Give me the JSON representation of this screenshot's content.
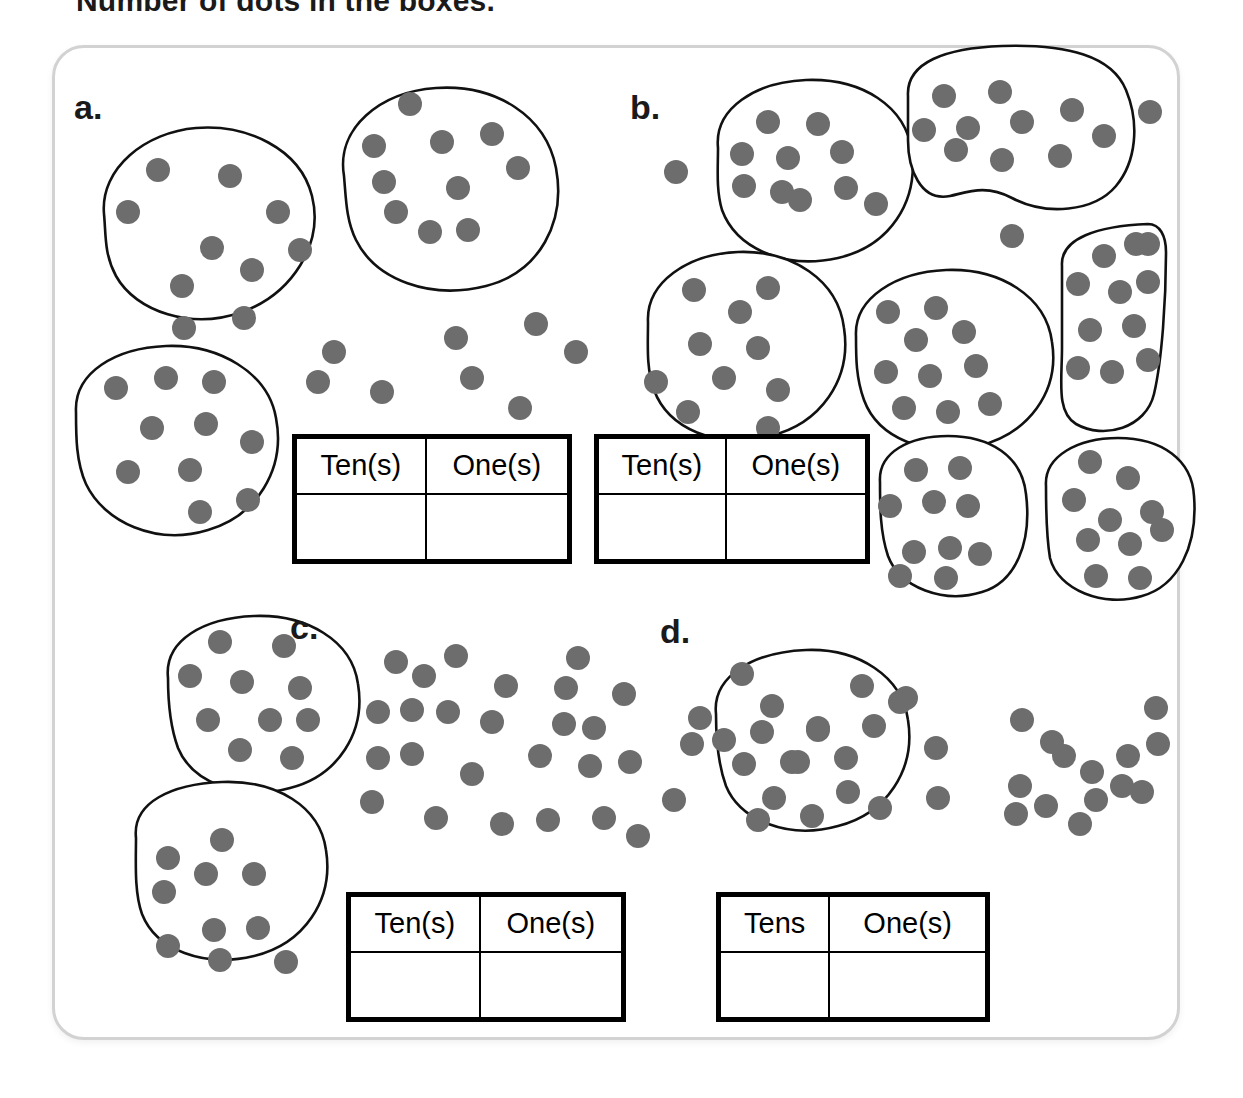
{
  "title": "Number of dots in the boxes.",
  "colors": {
    "dot": "#6d6d6d",
    "outline": "#111111",
    "frame": "#d2d2d2",
    "text": "#1a1a1a"
  },
  "frame": {
    "label": "worksheet-card"
  },
  "table_headers": {
    "tens_plural_optional": "Ten(s)",
    "tens_plain": "Tens",
    "ones_plural_optional": "One(s)"
  },
  "panels": [
    {
      "id": "a",
      "label": "a.",
      "groups_of_ten": 3,
      "loose_dots": 8,
      "total": 38,
      "table": {
        "col1": "Ten(s)",
        "col2": "One(s)",
        "answer1": "",
        "answer2": ""
      }
    },
    {
      "id": "b",
      "label": "b.",
      "groups_of_ten": 6,
      "loose_dots": 4,
      "total": 64,
      "table": {
        "col1": "Ten(s)",
        "col2": "One(s)",
        "answer1": "",
        "answer2": ""
      }
    },
    {
      "id": "c",
      "label": "c.",
      "groups_of_ten": 2,
      "loose_dots": 34,
      "total": 54,
      "table": {
        "col1": "Ten(s)",
        "col2": "One(s)",
        "answer1": "",
        "answer2": ""
      }
    },
    {
      "id": "d",
      "label": "d.",
      "groups_of_ten": 1,
      "loose_dots": 17,
      "total": 27,
      "table": {
        "col1": "Tens",
        "col2": "One(s)",
        "answer1": "",
        "answer2": ""
      }
    }
  ],
  "art": {
    "dot_radius": 12,
    "blobs": [
      {
        "panel": "a",
        "name": "blob-a-1",
        "path": "M104,214 C100,168 146,132 196,128 C246,124 300,148 312,196 C324,244 292,294 242,312 C192,330 136,312 116,276 C104,254 106,234 104,214 Z",
        "dots": [
          [
            158,
            170
          ],
          [
            230,
            176
          ],
          [
            128,
            212
          ],
          [
            212,
            248
          ],
          [
            278,
            212
          ],
          [
            182,
            286
          ],
          [
            252,
            270
          ],
          [
            300,
            250
          ],
          [
            184,
            328
          ],
          [
            244,
            318
          ]
        ]
      },
      {
        "panel": "a",
        "name": "blob-a-2",
        "path": "M344,176 C336,128 380,92 436,88 C496,84 546,116 556,168 C566,222 540,272 486,286 C430,300 376,280 356,240 C346,220 346,198 344,176 Z",
        "dots": [
          [
            410,
            104
          ],
          [
            374,
            146
          ],
          [
            492,
            134
          ],
          [
            442,
            142
          ],
          [
            518,
            168
          ],
          [
            458,
            188
          ],
          [
            384,
            182
          ],
          [
            430,
            232
          ],
          [
            468,
            230
          ],
          [
            396,
            212
          ]
        ]
      },
      {
        "panel": "a",
        "name": "blob-a-3",
        "path": "M76,412 C74,372 116,348 166,346 C218,344 268,372 276,418 C286,470 256,516 208,530 C156,546 104,522 86,484 C76,462 76,436 76,412 Z",
        "dots": [
          [
            116,
            388
          ],
          [
            166,
            378
          ],
          [
            214,
            382
          ],
          [
            152,
            428
          ],
          [
            206,
            424
          ],
          [
            252,
            442
          ],
          [
            128,
            472
          ],
          [
            190,
            470
          ],
          [
            200,
            512
          ],
          [
            248,
            500
          ]
        ]
      },
      {
        "panel": "b",
        "name": "blob-b-1",
        "path": "M718,148 C714,108 756,82 806,80 C862,78 906,106 912,152 C918,202 890,246 838,258 C784,270 736,248 722,210 C716,190 718,168 718,148 Z",
        "dots": [
          [
            768,
            122
          ],
          [
            818,
            124
          ],
          [
            742,
            154
          ],
          [
            788,
            158
          ],
          [
            842,
            152
          ],
          [
            782,
            192
          ],
          [
            846,
            188
          ],
          [
            744,
            186
          ],
          [
            800,
            200
          ],
          [
            876,
            204
          ]
        ]
      },
      {
        "panel": "b",
        "name": "blob-b-2",
        "path": "M908,96 C906,62 946,48 1002,46 C1068,44 1112,56 1126,90 C1140,124 1136,162 1116,186 C1094,212 1046,216 1012,198 C986,184 968,192 950,196 C920,202 908,168 908,140 Z",
        "dots": [
          [
            944,
            96
          ],
          [
            1000,
            92
          ],
          [
            924,
            130
          ],
          [
            968,
            128
          ],
          [
            1022,
            122
          ],
          [
            1072,
            110
          ],
          [
            1104,
            136
          ],
          [
            956,
            150
          ],
          [
            1002,
            160
          ],
          [
            1060,
            156
          ]
        ]
      },
      {
        "panel": "b",
        "name": "blob-b-3",
        "path": "M648,322 C646,282 688,254 738,252 C792,250 838,280 844,328 C852,380 820,424 770,436 C716,450 668,428 654,390 C646,368 648,344 648,322 Z",
        "dots": [
          [
            694,
            290
          ],
          [
            740,
            312
          ],
          [
            768,
            288
          ],
          [
            700,
            344
          ],
          [
            758,
            348
          ],
          [
            724,
            378
          ],
          [
            778,
            390
          ],
          [
            656,
            382
          ],
          [
            688,
            412
          ],
          [
            768,
            428
          ]
        ]
      },
      {
        "panel": "b",
        "name": "blob-b-4",
        "path": "M856,336 C854,298 896,272 946,270 C1000,268 1046,296 1052,342 C1060,392 1028,434 978,446 C926,458 878,438 864,400 C856,378 856,358 856,336 Z",
        "dots": [
          [
            888,
            312
          ],
          [
            936,
            308
          ],
          [
            916,
            340
          ],
          [
            964,
            332
          ],
          [
            886,
            372
          ],
          [
            930,
            376
          ],
          [
            976,
            366
          ],
          [
            904,
            408
          ],
          [
            948,
            412
          ],
          [
            990,
            404
          ]
        ]
      },
      {
        "panel": "b",
        "name": "blob-b-5",
        "path": "M1062,266 C1060,238 1098,226 1148,224 C1160,224 1166,236 1166,252 C1166,300 1162,360 1154,394 C1146,428 1104,440 1076,424 C1056,412 1062,380 1062,348 Z",
        "dots": [
          [
            1104,
            256
          ],
          [
            1148,
            244
          ],
          [
            1078,
            284
          ],
          [
            1120,
            292
          ],
          [
            1148,
            282
          ],
          [
            1090,
            330
          ],
          [
            1134,
            326
          ],
          [
            1078,
            368
          ],
          [
            1112,
            372
          ],
          [
            1148,
            360
          ]
        ]
      },
      {
        "panel": "b",
        "name": "blob-b-6",
        "path": "M880,482 C878,452 910,436 948,436 C990,436 1022,456 1026,494 C1032,542 1016,582 982,592 C944,604 900,588 888,556 C880,532 880,506 880,482 Z",
        "dots": [
          [
            916,
            470
          ],
          [
            960,
            468
          ],
          [
            890,
            506
          ],
          [
            934,
            502
          ],
          [
            968,
            506
          ],
          [
            914,
            552
          ],
          [
            950,
            548
          ],
          [
            980,
            554
          ],
          [
            900,
            576
          ],
          [
            946,
            578
          ]
        ]
      },
      {
        "panel": "b",
        "name": "blob-b-7",
        "path": "M1046,486 C1044,456 1078,438 1118,438 C1162,438 1192,460 1194,496 C1198,546 1178,586 1142,596 C1104,608 1058,590 1050,558 C1046,534 1046,510 1046,486 Z",
        "dots": [
          [
            1090,
            462
          ],
          [
            1128,
            478
          ],
          [
            1074,
            500
          ],
          [
            1110,
            520
          ],
          [
            1152,
            512
          ],
          [
            1088,
            540
          ],
          [
            1130,
            544
          ],
          [
            1162,
            530
          ],
          [
            1096,
            576
          ],
          [
            1140,
            578
          ]
        ]
      },
      {
        "panel": "c",
        "name": "blob-c-1",
        "path": "M168,678 C164,640 204,618 254,616 C306,614 352,640 358,684 C366,732 338,776 290,788 C240,802 192,782 178,748 C170,726 168,700 168,678 Z",
        "dots": [
          [
            220,
            642
          ],
          [
            284,
            646
          ],
          [
            190,
            676
          ],
          [
            242,
            682
          ],
          [
            300,
            688
          ],
          [
            208,
            720
          ],
          [
            270,
            720
          ],
          [
            308,
            720
          ],
          [
            240,
            750
          ],
          [
            292,
            758
          ]
        ]
      },
      {
        "panel": "c",
        "name": "blob-c-2",
        "path": "M136,838 C132,802 172,784 222,782 C276,780 320,806 326,850 C334,900 304,944 254,956 C204,968 156,950 142,914 C134,892 136,860 136,838 Z",
        "dots": [
          [
            222,
            840
          ],
          [
            168,
            858
          ],
          [
            206,
            874
          ],
          [
            254,
            874
          ],
          [
            164,
            892
          ],
          [
            214,
            930
          ],
          [
            258,
            928
          ],
          [
            168,
            946
          ],
          [
            220,
            960
          ],
          [
            286,
            962
          ]
        ]
      },
      {
        "panel": "d",
        "name": "blob-d-1",
        "path": "M716,714 C712,676 754,652 806,650 C858,648 902,676 908,720 C916,770 886,814 838,826 C788,840 740,820 726,786 C718,764 716,736 716,714 Z",
        "dots": [
          [
            762,
            732
          ],
          [
            818,
            730
          ],
          [
            744,
            764
          ],
          [
            792,
            762
          ],
          [
            846,
            758
          ],
          [
            774,
            798
          ],
          [
            848,
            792
          ],
          [
            758,
            820
          ],
          [
            812,
            816
          ],
          [
            880,
            808
          ]
        ]
      }
    ],
    "loose_dots": [
      {
        "panel": "a",
        "points": [
          [
            318,
            382
          ],
          [
            334,
            352
          ],
          [
            382,
            392
          ],
          [
            456,
            338
          ],
          [
            472,
            378
          ],
          [
            520,
            408
          ],
          [
            536,
            324
          ],
          [
            576,
            352
          ]
        ]
      },
      {
        "panel": "b",
        "points": [
          [
            676,
            172
          ],
          [
            1150,
            112
          ],
          [
            1012,
            236
          ],
          [
            1136,
            244
          ]
        ]
      },
      {
        "panel": "c",
        "points": [
          [
            396,
            662
          ],
          [
            424,
            676
          ],
          [
            456,
            656
          ],
          [
            578,
            658
          ],
          [
            506,
            686
          ],
          [
            566,
            688
          ],
          [
            624,
            694
          ],
          [
            742,
            674
          ],
          [
            862,
            686
          ],
          [
            900,
            702
          ],
          [
            378,
            712
          ],
          [
            412,
            710
          ],
          [
            448,
            712
          ],
          [
            492,
            722
          ],
          [
            564,
            724
          ],
          [
            594,
            728
          ],
          [
            700,
            718
          ],
          [
            772,
            706
          ],
          [
            818,
            728
          ],
          [
            874,
            726
          ],
          [
            378,
            758
          ],
          [
            412,
            754
          ],
          [
            472,
            774
          ],
          [
            540,
            756
          ],
          [
            590,
            766
          ],
          [
            630,
            762
          ],
          [
            692,
            744
          ],
          [
            724,
            740
          ],
          [
            798,
            762
          ],
          [
            372,
            802
          ],
          [
            436,
            818
          ],
          [
            502,
            824
          ],
          [
            548,
            820
          ],
          [
            604,
            818
          ],
          [
            638,
            836
          ],
          [
            674,
            800
          ]
        ]
      },
      {
        "panel": "d",
        "points": [
          [
            906,
            698
          ],
          [
            936,
            748
          ],
          [
            938,
            798
          ],
          [
            1022,
            720
          ],
          [
            1052,
            742
          ],
          [
            1020,
            786
          ],
          [
            1046,
            806
          ],
          [
            1064,
            756
          ],
          [
            1092,
            772
          ],
          [
            1096,
            800
          ],
          [
            1122,
            786
          ],
          [
            1156,
            708
          ],
          [
            1128,
            756
          ],
          [
            1142,
            792
          ],
          [
            1080,
            824
          ],
          [
            1016,
            814
          ],
          [
            1158,
            744
          ]
        ]
      }
    ]
  }
}
